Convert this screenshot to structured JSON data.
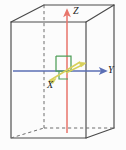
{
  "figure": {
    "name": "3d-cartesian-axes-in-rectangular-box",
    "type": "diagram",
    "width": 126,
    "height": 150,
    "background": "#fcfcfc"
  },
  "labels": {
    "z": "Z",
    "y": "Y",
    "x": "X"
  },
  "colors": {
    "box_edge": "#4a4a4a",
    "box_hidden_edge": "#6f6f6f",
    "z_axis": "#e8756b",
    "y_axis": "#5b6fb5",
    "x_axis": "#d8d05a",
    "right_angle_marker": "#4f9e58",
    "label_text": "#1b1b1b"
  },
  "geometry": {
    "box": {
      "front_face": [
        {
          "x": 11,
          "y": 22
        },
        {
          "x": 86,
          "y": 22
        },
        {
          "x": 86,
          "y": 138
        },
        {
          "x": 11,
          "y": 138
        }
      ],
      "back_face": [
        {
          "x": 44,
          "y": 5
        },
        {
          "x": 114,
          "y": 5
        },
        {
          "x": 114,
          "y": 128
        },
        {
          "x": 44,
          "y": 128
        }
      ],
      "hidden_vertical_edge": {
        "x": 44,
        "y1": 5,
        "y2": 128
      },
      "hidden_bottom_edges": [
        {
          "x1": 11,
          "y1": 138,
          "x2": 44,
          "y2": 128
        },
        {
          "x1": 44,
          "y1": 128,
          "x2": 114,
          "y2": 128
        }
      ]
    },
    "axes": {
      "z": {
        "x": 67,
        "y_bottom": 133,
        "y_tip": 9,
        "direction": "up"
      },
      "y": {
        "y": 71,
        "x_start": 13,
        "x_tip": 106,
        "direction": "right"
      },
      "x": {
        "x_start": 78,
        "y_start": 63,
        "x_tip": 48,
        "y_tip": 82,
        "direction": "down-left-toward-viewer"
      }
    },
    "right_angle_marker": {
      "x": 56,
      "y": 56,
      "size": 15
    }
  },
  "elements": [
    {
      "name": "box-outline",
      "description": "transparent rectangular prism drawn in perspective"
    },
    {
      "name": "z-axis-arrow",
      "description": "red vertical arrow pointing up through box center"
    },
    {
      "name": "y-axis-arrow",
      "description": "blue horizontal arrow pointing right"
    },
    {
      "name": "x-axis-arrow",
      "description": "yellow arrow pointing out of page toward lower-left"
    },
    {
      "name": "right-angle-marker",
      "description": "green square indicating perpendicularity at origin"
    }
  ]
}
